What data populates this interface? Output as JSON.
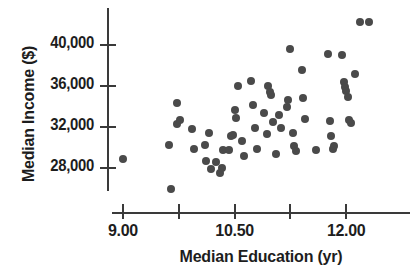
{
  "chart_data": {
    "type": "scatter",
    "title": "",
    "xlabel": "Median Education (yr)",
    "ylabel": "Median Income ($)",
    "xlim": [
      8.55,
      12.55
    ],
    "ylim": [
      25200,
      43200
    ],
    "grid": false,
    "legend": null,
    "xticks": [
      {
        "value": 9.0,
        "label": "9.00",
        "show_label": true
      },
      {
        "value": 9.75,
        "label": "",
        "show_label": false
      },
      {
        "value": 10.5,
        "label": "10.50",
        "show_label": true
      },
      {
        "value": 11.25,
        "label": "",
        "show_label": false
      },
      {
        "value": 12.0,
        "label": "12.00",
        "show_label": true
      }
    ],
    "yticks": [
      {
        "value": 40000,
        "label": "40,000"
      },
      {
        "value": 36000,
        "label": "36,000"
      },
      {
        "value": 32000,
        "label": "32,000"
      },
      {
        "value": 28000,
        "label": "28,000"
      }
    ],
    "marker": {
      "shape": "circle",
      "color": "#4a4a4a",
      "size_px": 8
    },
    "n_points": 62,
    "points": [
      [
        9.0,
        28900
      ],
      [
        9.65,
        26000
      ],
      [
        9.62,
        30200
      ],
      [
        9.72,
        34300
      ],
      [
        9.73,
        32300
      ],
      [
        9.76,
        32700
      ],
      [
        9.93,
        31800
      ],
      [
        9.95,
        29900
      ],
      [
        10.1,
        30200
      ],
      [
        10.12,
        28700
      ],
      [
        10.15,
        31400
      ],
      [
        10.18,
        27900
      ],
      [
        10.3,
        27500
      ],
      [
        10.33,
        28000
      ],
      [
        10.35,
        29800
      ],
      [
        10.48,
        31200
      ],
      [
        10.5,
        33700
      ],
      [
        10.52,
        32900
      ],
      [
        10.55,
        36000
      ],
      [
        10.6,
        30600
      ],
      [
        10.62,
        29200
      ],
      [
        10.72,
        36500
      ],
      [
        10.75,
        34100
      ],
      [
        10.78,
        31900
      ],
      [
        10.8,
        29900
      ],
      [
        10.9,
        33400
      ],
      [
        10.93,
        31300
      ],
      [
        10.95,
        36000
      ],
      [
        10.97,
        35400
      ],
      [
        10.99,
        35100
      ],
      [
        11.02,
        32500
      ],
      [
        11.05,
        29400
      ],
      [
        11.2,
        34000
      ],
      [
        11.22,
        34600
      ],
      [
        11.25,
        39600
      ],
      [
        11.28,
        31400
      ],
      [
        11.3,
        30100
      ],
      [
        11.33,
        29700
      ],
      [
        11.4,
        37600
      ],
      [
        11.42,
        34800
      ],
      [
        11.45,
        32800
      ],
      [
        11.75,
        39100
      ],
      [
        11.78,
        32600
      ],
      [
        11.8,
        31100
      ],
      [
        11.82,
        29900
      ],
      [
        11.84,
        30100
      ],
      [
        11.95,
        39000
      ],
      [
        11.97,
        36400
      ],
      [
        11.98,
        35900
      ],
      [
        12.0,
        35500
      ],
      [
        12.02,
        34900
      ],
      [
        12.04,
        32700
      ],
      [
        12.06,
        32400
      ],
      [
        12.12,
        37200
      ],
      [
        12.18,
        42200
      ],
      [
        12.3,
        42200
      ],
      [
        10.42,
        29800
      ],
      [
        10.45,
        31100
      ],
      [
        11.1,
        33200
      ],
      [
        11.12,
        31900
      ],
      [
        10.25,
        28600
      ],
      [
        11.6,
        29800
      ]
    ]
  }
}
